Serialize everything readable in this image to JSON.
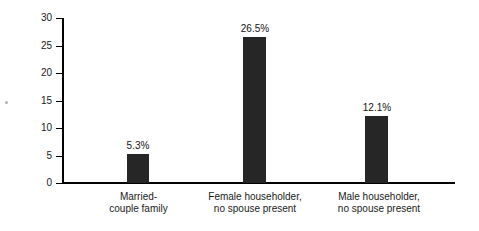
{
  "chart_data": {
    "type": "bar",
    "title": "",
    "xlabel": "",
    "ylabel": "Percent",
    "categories": [
      "Married-\ncouple family",
      "Female householder,\nno spouse present",
      "Male householder,\nno spouse present"
    ],
    "values": [
      5.3,
      12.1,
      26.5
    ],
    "series": [
      {
        "name": "Percent",
        "values": [
          5.3,
          26.5,
          12.1
        ]
      }
    ],
    "value_labels": [
      "5.3%",
      "26.5%",
      "12.1%"
    ],
    "ylim": [
      0,
      30
    ],
    "yticks": [
      0,
      5,
      10,
      15,
      20,
      25,
      30
    ],
    "ytick_labels": [
      "0",
      "5",
      "10",
      "15",
      "20",
      "25",
      "30"
    ],
    "grid": false,
    "legend": false,
    "bar_color": "#262626",
    "axis_color": "#000000",
    "background": "#ffffff"
  },
  "bars": [
    {
      "category": "Married-\ncouple family",
      "value": 5.3,
      "label": "5.3%",
      "left": 127,
      "width": 22,
      "label_left": 113,
      "label_width": 50,
      "cat_left": 86,
      "cat_width": 105
    },
    {
      "category": "Female householder,\nno spouse present",
      "value": 26.5,
      "label": "26.5%",
      "left": 243,
      "width": 23,
      "label_left": 229,
      "label_width": 52,
      "cat_left": 192,
      "cat_width": 126
    },
    {
      "category": "Male householder,\nno spouse present",
      "value": 12.1,
      "label": "12.1%",
      "left": 365,
      "width": 23,
      "label_left": 351,
      "label_width": 52,
      "cat_left": 317,
      "cat_width": 124
    }
  ]
}
